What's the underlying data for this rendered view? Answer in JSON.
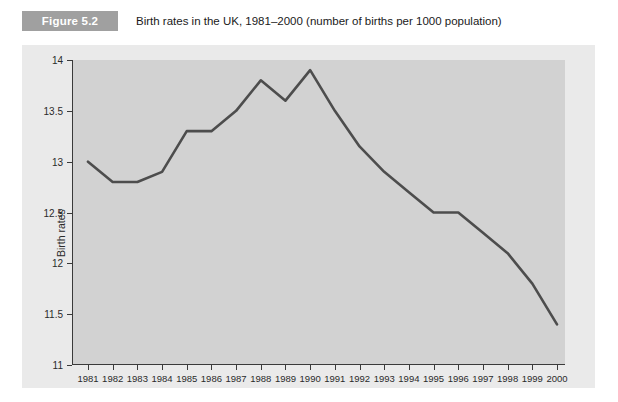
{
  "figure": {
    "badge_label": "Figure 5.2",
    "caption": "Birth rates in the UK, 1981–2000 (number of births per 1000 population)",
    "badge_color": "#a0a0a0",
    "panel_color": "#eaeaea",
    "plot_color": "#d2d2d2",
    "line_color": "#4d4d4d"
  },
  "chart_data": {
    "type": "line",
    "title": "Birth rates in the UK, 1981–2000 (number of births per 1000 population)",
    "xlabel": "",
    "ylabel": "Birth rates",
    "categories": [
      "1981",
      "1982",
      "1983",
      "1984",
      "1985",
      "1986",
      "1987",
      "1988",
      "1989",
      "1990",
      "1991",
      "1992",
      "1993",
      "1994",
      "1995",
      "1996",
      "1997",
      "1998",
      "1999",
      "2000"
    ],
    "values": [
      13.0,
      12.8,
      12.8,
      12.9,
      13.3,
      13.3,
      13.5,
      13.8,
      13.6,
      13.9,
      13.5,
      13.15,
      12.9,
      12.7,
      12.5,
      12.5,
      12.3,
      12.1,
      11.8,
      11.4
    ],
    "ylim": [
      11,
      14
    ],
    "yticks": [
      14,
      13.5,
      13,
      12.5,
      12,
      11.5,
      11
    ],
    "ytick_labels": [
      "14",
      "13.5",
      "13",
      "12.5",
      "12",
      "11.5",
      "11"
    ],
    "grid": false,
    "legend": false,
    "series": [
      {
        "name": "Birth rates",
        "values": [
          13.0,
          12.8,
          12.8,
          12.9,
          13.3,
          13.3,
          13.5,
          13.8,
          13.6,
          13.9,
          13.5,
          13.15,
          12.9,
          12.7,
          12.5,
          12.5,
          12.3,
          12.1,
          11.8,
          11.4
        ]
      }
    ]
  }
}
